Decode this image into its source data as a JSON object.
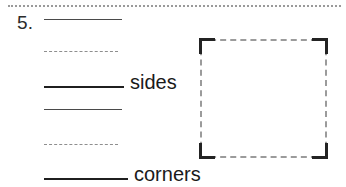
{
  "worksheet": {
    "separator": {
      "style": "dotted",
      "color": "#9a9a9a"
    },
    "question": {
      "number_label": "5.",
      "blanks": [
        {
          "id": "blank-1",
          "label": "",
          "line_style": "solid-thin",
          "line_width": 78
        },
        {
          "id": "blank-2",
          "label": "",
          "line_style": "dashed",
          "line_width": 74
        },
        {
          "id": "blank-3",
          "label": "sides",
          "line_style": "solid-thick",
          "line_width": 80
        },
        {
          "id": "blank-4",
          "label": "",
          "line_style": "solid-thin",
          "line_width": 78
        },
        {
          "id": "blank-5",
          "label": "",
          "line_style": "dashed",
          "line_width": 74
        },
        {
          "id": "blank-6",
          "label": "corners",
          "line_style": "solid-thick",
          "line_width": 84
        }
      ]
    },
    "figure": {
      "shape_name": "square",
      "edge_style": "dashed",
      "edge_color": "#9b9b9b",
      "corner_color": "#232323",
      "corner_count": 4,
      "side_count": 4
    }
  }
}
